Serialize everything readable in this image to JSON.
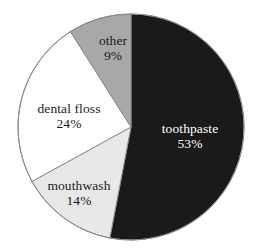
{
  "chart_data": {
    "type": "pie",
    "title": "",
    "subtitle": "",
    "xlabel": "",
    "ylabel": "",
    "legend": "none",
    "grid": false,
    "units": "percent",
    "total": 100,
    "start_angle_deg": 0,
    "direction": "clockwise",
    "categories": [
      "toothpaste",
      "mouthwash",
      "dental floss",
      "other"
    ],
    "values": [
      53,
      14,
      24,
      9
    ],
    "slices": [
      {
        "label": "toothpaste",
        "value": 53,
        "value_text": "53%",
        "color": "#1a1a1a",
        "text_color": "#ffffff",
        "start_deg": 0,
        "end_deg": 190.8,
        "label_x": 190,
        "label_y": 137
      },
      {
        "label": "mouthwash",
        "value": 14,
        "value_text": "14%",
        "color": "#e8e8e8",
        "text_color": "#1a1a1a",
        "start_deg": 190.8,
        "end_deg": 241.2,
        "label_x": 79,
        "label_y": 194
      },
      {
        "label": "dental floss",
        "value": 24,
        "value_text": "24%",
        "color": "#ffffff",
        "text_color": "#1a1a1a",
        "start_deg": 241.2,
        "end_deg": 327.6,
        "label_x": 69,
        "label_y": 117
      },
      {
        "label": "other",
        "value": 9,
        "value_text": "9%",
        "color": "#a8a8a8",
        "text_color": "#1a1a1a",
        "start_deg": 327.6,
        "end_deg": 360,
        "label_x": 113,
        "label_y": 49
      }
    ],
    "geometry": {
      "center_x": 131,
      "center_y": 127,
      "radius": 113
    },
    "style": {
      "background": "#ffffff",
      "outline_color": "#8a8a8a",
      "outline_width": 1
    }
  }
}
